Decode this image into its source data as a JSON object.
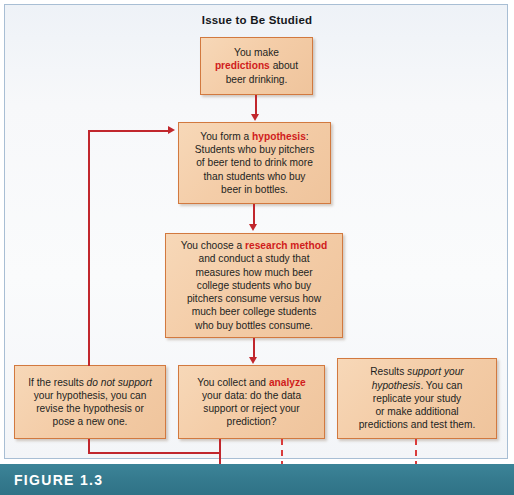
{
  "figure": {
    "title": "Issue to Be Studied",
    "caption_label": "FIGURE 1.3"
  },
  "colors": {
    "box_fill": "#f4cda8",
    "box_border": "#d2793f",
    "connector": "#c1272d",
    "dashed_connector": "#d93b3b",
    "keyword": "#d01c1c",
    "caption_bar": "#357a8e",
    "frame_border": "#a8bed4",
    "canvas_background": "#f4f6f9"
  },
  "boxes": {
    "predictions": {
      "name": "predictions",
      "lines": [
        [
          {
            "t": "You make",
            "style": "plain"
          }
        ],
        [
          {
            "t": "predictions",
            "style": "keyword"
          },
          {
            "t": " about",
            "style": "plain"
          }
        ],
        [
          {
            "t": "beer drinking.",
            "style": "plain"
          }
        ]
      ],
      "plain_text": "You make predictions about beer drinking."
    },
    "hypothesis": {
      "name": "hypothesis",
      "lines": [
        [
          {
            "t": "You form a ",
            "style": "plain"
          },
          {
            "t": "hypothesis",
            "style": "keyword"
          },
          {
            "t": ":",
            "style": "plain"
          }
        ],
        [
          {
            "t": "Students who buy pitchers",
            "style": "plain"
          }
        ],
        [
          {
            "t": "of beer tend to drink more",
            "style": "plain"
          }
        ],
        [
          {
            "t": "than students who buy",
            "style": "plain"
          }
        ],
        [
          {
            "t": "beer in bottles.",
            "style": "plain"
          }
        ]
      ],
      "plain_text": "You form a hypothesis: Students who buy pitchers of beer tend to drink more than students who buy beer in bottles."
    },
    "research_method": {
      "name": "research-method",
      "lines": [
        [
          {
            "t": "You choose a ",
            "style": "plain"
          },
          {
            "t": "research method",
            "style": "keyword"
          }
        ],
        [
          {
            "t": "and conduct a study that",
            "style": "plain"
          }
        ],
        [
          {
            "t": "measures how much beer",
            "style": "plain"
          }
        ],
        [
          {
            "t": "college students who buy",
            "style": "plain"
          }
        ],
        [
          {
            "t": "pitchers consume versus how",
            "style": "plain"
          }
        ],
        [
          {
            "t": "much beer college students",
            "style": "plain"
          }
        ],
        [
          {
            "t": "who buy bottles consume.",
            "style": "plain"
          }
        ]
      ],
      "plain_text": "You choose a research method and conduct a study that measures how much beer college students who buy pitchers consume versus how much beer college students who buy bottles consume."
    },
    "no_support": {
      "name": "results-do-not-support",
      "lines": [
        [
          {
            "t": "If the results ",
            "style": "plain"
          },
          {
            "t": "do not support",
            "style": "italic"
          }
        ],
        [
          {
            "t": "your hypothesis, you can",
            "style": "plain"
          }
        ],
        [
          {
            "t": "revise the hypothesis or",
            "style": "plain"
          }
        ],
        [
          {
            "t": "pose a new one.",
            "style": "plain"
          }
        ]
      ],
      "plain_text": "If the results do not support your hypothesis, you can revise the hypothesis or pose a new one."
    },
    "analyze": {
      "name": "collect-and-analyze",
      "lines": [
        [
          {
            "t": "You collect and ",
            "style": "plain"
          },
          {
            "t": "analyze",
            "style": "keyword"
          }
        ],
        [
          {
            "t": "your data: do the data",
            "style": "plain"
          }
        ],
        [
          {
            "t": "support or reject your",
            "style": "plain"
          }
        ],
        [
          {
            "t": "prediction?",
            "style": "plain"
          }
        ]
      ],
      "plain_text": "You collect and analyze your data: do the data support or reject your prediction?"
    },
    "support": {
      "name": "results-support",
      "lines": [
        [
          {
            "t": "Results ",
            "style": "plain"
          },
          {
            "t": "support your",
            "style": "italic"
          }
        ],
        [
          {
            "t": "hypothesis",
            "style": "italic"
          },
          {
            "t": ". You can",
            "style": "plain"
          }
        ],
        [
          {
            "t": "replicate your study",
            "style": "plain"
          }
        ],
        [
          {
            "t": "or make additional",
            "style": "plain"
          }
        ],
        [
          {
            "t": "predictions and test them.",
            "style": "plain"
          }
        ]
      ],
      "plain_text": "Results support your hypothesis. You can replicate your study or make additional predictions and test them."
    }
  }
}
